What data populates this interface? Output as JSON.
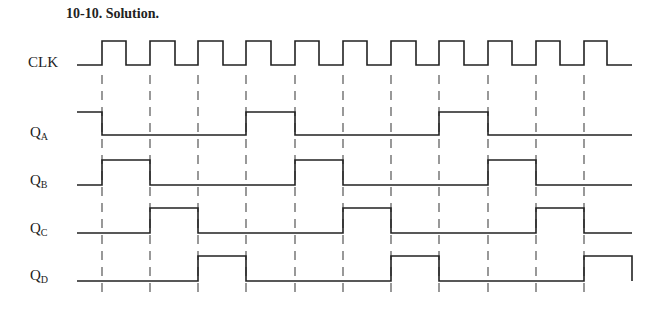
{
  "title": "10-10.  Solution.",
  "signals": [
    {
      "name": "CLK",
      "main": "CLK",
      "sub": "",
      "label_y": 47,
      "high_y": 41,
      "low_y": 65,
      "initial": 0,
      "transitions": [
        102,
        126,
        150,
        175,
        198,
        223,
        246,
        271,
        295,
        319,
        343,
        367,
        391,
        416,
        439,
        464,
        488,
        512,
        536,
        560,
        584,
        607
      ],
      "end_x": 632
    },
    {
      "name": "QA",
      "main": "Q",
      "sub": "A",
      "label_y": 120,
      "high_y": 112,
      "low_y": 135,
      "initial": 1,
      "transitions": [
        102,
        246,
        295,
        439,
        488
      ],
      "end_x": 632
    },
    {
      "name": "QB",
      "main": "Q",
      "sub": "B",
      "label_y": 168,
      "high_y": 160,
      "low_y": 185,
      "initial": 0,
      "transitions": [
        102,
        150,
        295,
        343,
        488,
        536
      ],
      "end_x": 632
    },
    {
      "name": "QC",
      "main": "Q",
      "sub": "C",
      "label_y": 216,
      "high_y": 208,
      "low_y": 233,
      "initial": 0,
      "transitions": [
        150,
        198,
        343,
        391,
        536,
        584
      ],
      "end_x": 632
    },
    {
      "name": "QD",
      "main": "Q",
      "sub": "D",
      "label_y": 264,
      "high_y": 256,
      "low_y": 281,
      "initial": 0,
      "transitions": [
        198,
        246,
        391,
        439,
        584
      ],
      "end_x": 632,
      "final_drop": true
    }
  ],
  "start_x": 77,
  "clock_rising_edges": [
    102,
    150,
    198,
    246,
    295,
    343,
    391,
    439,
    488,
    536,
    584
  ],
  "dashed_range": [
    75,
    292
  ],
  "line_color": "#222222"
}
